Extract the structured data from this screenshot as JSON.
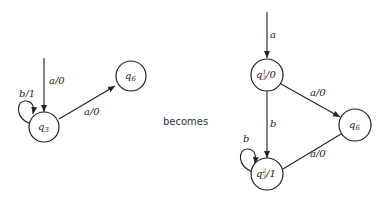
{
  "connector_text": "becomes",
  "left_machine": {
    "nodes": [
      {
        "id": "q3",
        "label": "q",
        "sub": "3",
        "suffix": ""
      },
      {
        "id": "q6",
        "label": "q",
        "sub": "6",
        "suffix": ""
      }
    ],
    "edges": [
      {
        "from": "start",
        "to": "q3",
        "label": "a/0"
      },
      {
        "from": "q3",
        "to": "q3",
        "label": "b/1"
      },
      {
        "from": "q3",
        "to": "q6",
        "label": "a/0"
      }
    ]
  },
  "right_machine": {
    "nodes": [
      {
        "id": "q3_1",
        "label": "q",
        "sup": "1",
        "sub": "3",
        "suffix": "/0"
      },
      {
        "id": "q3_2",
        "label": "q",
        "sup": "2",
        "sub": "3",
        "suffix": "/1"
      },
      {
        "id": "q6",
        "label": "q",
        "sub": "6",
        "suffix": ""
      }
    ],
    "edges": [
      {
        "from": "start",
        "to": "q3_1",
        "label": "a"
      },
      {
        "from": "q3_1",
        "to": "q3_2",
        "label": "b"
      },
      {
        "from": "q3_2",
        "to": "q3_2",
        "label": "b"
      },
      {
        "from": "q3_1",
        "to": "q6",
        "label": "a/0"
      },
      {
        "from": "q6",
        "to": "q3_2",
        "label": "a/0"
      }
    ]
  }
}
